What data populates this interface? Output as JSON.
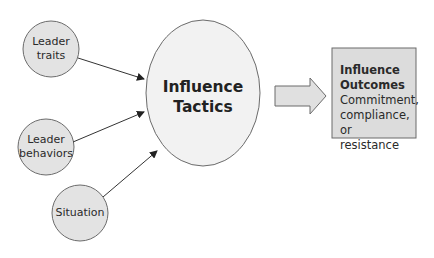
{
  "diagram": {
    "inputs": [
      {
        "id": "leader-traits",
        "lines": [
          "Leader",
          "traits"
        ]
      },
      {
        "id": "leader-behaviors",
        "lines": [
          "Leader",
          "behaviors"
        ]
      },
      {
        "id": "situation",
        "lines": [
          "Situation"
        ]
      }
    ],
    "center": {
      "lines": [
        "Influence",
        "Tactics"
      ]
    },
    "output": {
      "title_lines": [
        "Influence",
        "Outcomes"
      ],
      "body_lines": [
        "Commitment,",
        "compliance, or",
        "resistance"
      ]
    },
    "colors": {
      "node_fill": "#e3e3e3",
      "node_stroke": "#6b6b6b",
      "center_fill": "#f2f2f2",
      "box_fill": "#dcdcdc",
      "arrow_fill": "#e0e0e0",
      "line": "#333333"
    }
  }
}
